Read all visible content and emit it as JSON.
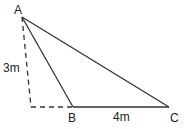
{
  "diagram": {
    "type": "triangle",
    "points": {
      "A": {
        "label": "A",
        "x": 22,
        "y": 17
      },
      "B": {
        "label": "B",
        "x": 73,
        "y": 107
      },
      "C": {
        "label": "C",
        "x": 169,
        "y": 107
      },
      "foot": {
        "x": 31,
        "y": 107
      }
    },
    "edges": [
      {
        "from": "A",
        "to": "B",
        "style": "solid"
      },
      {
        "from": "A",
        "to": "C",
        "style": "solid"
      },
      {
        "from": "B",
        "to": "C",
        "style": "solid"
      },
      {
        "from": "A",
        "to": "foot",
        "style": "dashed"
      },
      {
        "from": "foot",
        "to": "B",
        "style": "dashed"
      }
    ],
    "measurements": {
      "height_label": "3m",
      "base_label": "4m"
    },
    "colors": {
      "line": "#333333",
      "text": "#222222"
    }
  }
}
